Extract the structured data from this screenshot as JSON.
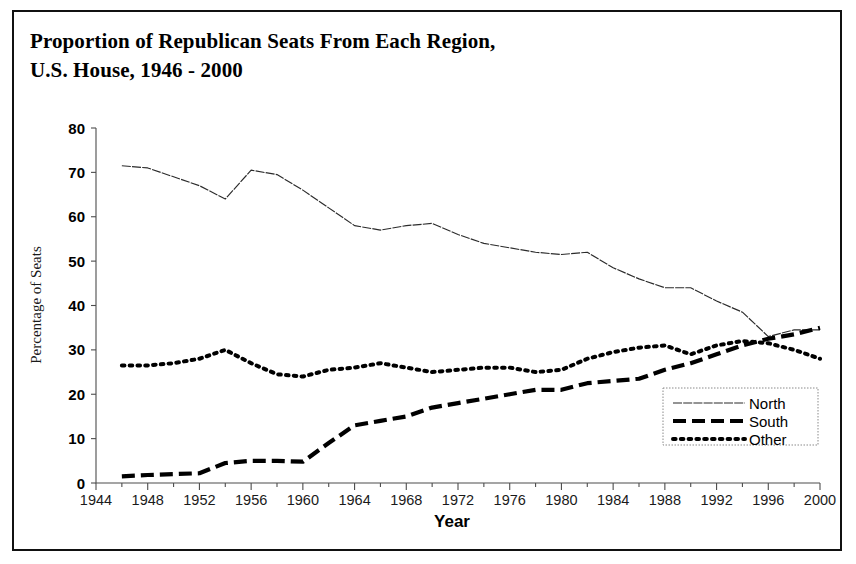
{
  "figure": {
    "title_line1": "Proportion of Republican Seats From Each Region,",
    "title_line2": "U.S. House, 1946 - 2000"
  },
  "chart_data": {
    "type": "line",
    "title": "Proportion of Republican Seats From Each Region, U.S. House, 1946 - 2000",
    "xlabel": "Year",
    "ylabel": "Percentage of Seats",
    "xlim": [
      1944,
      2000
    ],
    "ylim": [
      0,
      80
    ],
    "ytick_labels": [
      "0",
      "10",
      "20",
      "30",
      "40",
      "50",
      "60",
      "70",
      "80"
    ],
    "yticks": [
      0,
      10,
      20,
      30,
      40,
      50,
      60,
      70,
      80
    ],
    "xtick_labels": [
      "1944",
      "1948",
      "1952",
      "1956",
      "1960",
      "1964",
      "1968",
      "1972",
      "1976",
      "1980",
      "1984",
      "1988",
      "1992",
      "1996",
      "2000"
    ],
    "xticks": [
      1944,
      1948,
      1952,
      1956,
      1960,
      1964,
      1968,
      1972,
      1976,
      1980,
      1984,
      1988,
      1992,
      1996,
      2000
    ],
    "minor_xticks": [
      1946,
      1950,
      1954,
      1958,
      1962,
      1966,
      1970,
      1974,
      1978,
      1982,
      1986,
      1990,
      1994,
      1998
    ],
    "grid": false,
    "legend_position": "lower right",
    "x": [
      1946,
      1948,
      1950,
      1952,
      1954,
      1956,
      1958,
      1960,
      1962,
      1964,
      1966,
      1968,
      1970,
      1972,
      1974,
      1976,
      1978,
      1980,
      1982,
      1984,
      1986,
      1988,
      1990,
      1992,
      1994,
      1996,
      1998,
      2000
    ],
    "series": [
      {
        "name": "North",
        "line_style": "fine-dotted",
        "values": [
          71.5,
          71.0,
          69.0,
          67.0,
          64.0,
          70.5,
          69.5,
          66.0,
          62.0,
          58.0,
          57.0,
          58.0,
          58.5,
          56.0,
          54.0,
          53.0,
          52.0,
          51.5,
          52.0,
          48.5,
          46.0,
          44.0,
          44.0,
          41.0,
          38.5,
          33.0,
          34.5,
          34.5
        ]
      },
      {
        "name": "South",
        "line_style": "long-dashed",
        "values": [
          1.5,
          1.8,
          2.0,
          2.2,
          4.5,
          5.0,
          5.0,
          4.8,
          9.0,
          13.0,
          14.0,
          15.0,
          17.0,
          18.0,
          19.0,
          20.0,
          21.0,
          21.0,
          22.5,
          23.0,
          23.5,
          25.5,
          27.0,
          29.0,
          31.0,
          32.5,
          33.5,
          35.0
        ]
      },
      {
        "name": "Other",
        "line_style": "dotted",
        "values": [
          26.5,
          26.5,
          27.0,
          28.0,
          30.0,
          27.0,
          24.5,
          24.0,
          25.5,
          26.0,
          27.0,
          26.0,
          25.0,
          25.5,
          26.0,
          26.0,
          25.0,
          25.5,
          28.0,
          29.5,
          30.5,
          31.0,
          29.0,
          31.0,
          32.0,
          31.5,
          30.0,
          28.0
        ]
      }
    ]
  },
  "legend": {
    "entries": [
      {
        "label": "North"
      },
      {
        "label": "South"
      },
      {
        "label": "Other"
      }
    ]
  }
}
